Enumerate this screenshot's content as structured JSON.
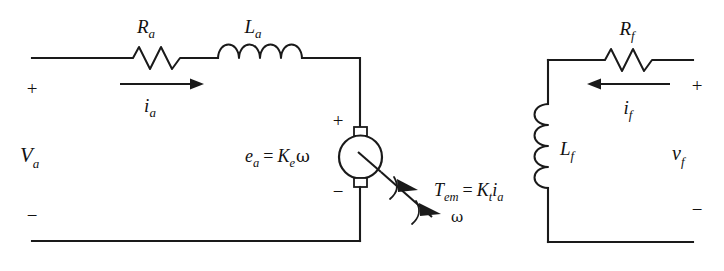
{
  "diagram": {
    "armature_circuit": {
      "source_label": "V",
      "source_sub": "a",
      "terminal_plus": "+",
      "terminal_minus": "−",
      "resistor": {
        "label": "R",
        "sub": "a",
        "icon": "resistor-icon"
      },
      "inductor": {
        "label": "L",
        "sub": "a",
        "icon": "inductor-icon"
      },
      "current": {
        "label": "i",
        "sub": "a",
        "icon": "current-arrow-right-icon"
      },
      "back_emf": {
        "lhs": "e",
        "lhs_sub": "a",
        "equals": "=",
        "gain": "K",
        "gain_sub": "e",
        "omega": "ω"
      },
      "machine": {
        "icon": "dc-motor-icon",
        "terminal_plus": "+",
        "terminal_minus": "−"
      }
    },
    "shaft": {
      "torque": {
        "lhs": "T",
        "lhs_sub": "em",
        "equals": "=",
        "gain": "K",
        "gain_sub": "t",
        "current": "i",
        "current_sub": "a"
      },
      "speed": "ω",
      "icon": "shaft-arrow-icon"
    },
    "field_circuit": {
      "source_label": "v",
      "source_sub": "f",
      "terminal_plus": "+",
      "terminal_minus": "−",
      "resistor": {
        "label": "R",
        "sub": "f",
        "icon": "resistor-icon"
      },
      "inductor": {
        "label": "L",
        "sub": "f",
        "icon": "inductor-vertical-icon"
      },
      "current": {
        "label": "i",
        "sub": "f",
        "icon": "current-arrow-left-icon"
      }
    },
    "colors": {
      "ink": "#1a1a1a",
      "background": "#ffffff"
    }
  }
}
